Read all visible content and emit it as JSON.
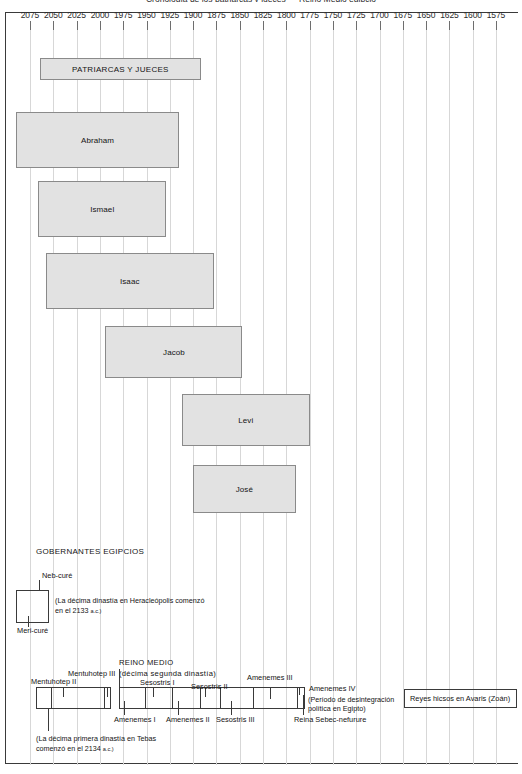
{
  "chart_title": "Cronología de los patriarcas y jueces — Reino Medio egipcio",
  "chart_data": {
    "type": "bar",
    "orientation": "horizontal",
    "title": "Cronología de los patriarcas y jueces — Reino Medio egipcio",
    "xlabel": "",
    "ylabel": "",
    "axis": {
      "direction": "descending",
      "unit": "a.C.",
      "start": 2075,
      "end": 1575,
      "step": 25,
      "tick_labels": [
        "2075",
        "2050",
        "2025",
        "2000",
        "1975",
        "1950",
        "1925",
        "1900",
        "1875",
        "1850",
        "1825",
        "1800",
        "1775",
        "1750",
        "1725",
        "1700",
        "1675",
        "1650",
        "1625",
        "1600",
        "1575"
      ],
      "grid": true,
      "legend": "none"
    },
    "sections": [
      {
        "name": "PATRIARCAS Y JUECES"
      },
      {
        "name": "GOBERNANTES EGIPCIOS"
      }
    ],
    "bars": [
      {
        "label": "PATRIARCAS Y JUECES",
        "start": 2064,
        "end": 1892,
        "style": "filled",
        "caps": true
      },
      {
        "label": "Abraham",
        "start": 2090,
        "end": 1915,
        "style": "filled",
        "caps": false
      },
      {
        "label": "Ismael",
        "start": 2066,
        "end": 1929,
        "style": "filled",
        "caps": false
      },
      {
        "label": "Isaac",
        "start": 2058,
        "end": 1878,
        "style": "filled",
        "caps": false
      },
      {
        "label": "Jacob",
        "start": 1994,
        "end": 1847,
        "style": "filled",
        "caps": false
      },
      {
        "label": "Levi",
        "start": 1912,
        "end": 1775,
        "style": "filled",
        "caps": false
      },
      {
        "label": "José",
        "start": 1900,
        "end": 1790,
        "style": "filled",
        "caps": false
      }
    ],
    "egyptian_rulers": {
      "heading": "GOBERNANTES EGIPCIOS",
      "early": {
        "rulers": [
          "Neb-curé",
          "Meri-curé"
        ],
        "note": "(La décima dinastía en Heracleópolis comenzó en el 2133 a.c.)"
      },
      "middle_kingdom": {
        "heading_line1": "REINO MEDIO",
        "heading_line2": "(décima segunda dinastía)",
        "rulers_above": [
          "Mentuhotep II",
          "Mentuhotep III",
          "Sesostris I",
          "Sesostris II",
          "Amenemes III",
          "Amenemes IV"
        ],
        "rulers_below": [
          "Amenemes I",
          "Amenemes II",
          "Sesostris III",
          "Reina Sebec-nefurure"
        ],
        "note_right_line1": "(Período de desintegración",
        "note_right_line2": "política en Egipto)",
        "note_below": "(La décima primera dinastía en Tebas comenzó en el 2134 a.c.)"
      },
      "hyksos": {
        "label": "Reyes hicsos en Avaris (Zoán)"
      }
    },
    "colors": {
      "bar_fill": "#e2e2e2",
      "bar_border": "#8a8a8a",
      "grid": "#d7d7d7",
      "frame": "#3a3a3a",
      "text": "#141414"
    }
  },
  "labels": {
    "title": "Cronología de los patriarcas y jueces — Reino Medio egipcio",
    "patriarcas": "PATRIARCAS Y JUECES",
    "abraham": "Abraham",
    "ismael": "Ismael",
    "isaac": "Isaac",
    "jacob": "Jacob",
    "levi": "Levi",
    "jose": "José",
    "gobernantes": "GOBERNANTES EGIPCIOS",
    "neb_cure": "Neb-curé",
    "meri_cure": "Meri-curé",
    "note_heracleopolis_l1": "(La décima dinastía en Heracleópolis comenzó",
    "note_heracleopolis_l2": "en el 2133 ",
    "note_heracleopolis_sc": "a.c.)",
    "reino_medio_l1": "REINO MEDIO",
    "reino_medio_l2": "(décima segunda dinastía)",
    "mentuhotep_ii": "Mentuhotep II",
    "mentuhotep_iii": "Mentuhotep III",
    "sesostris_i": "Sesostris I",
    "sesostris_ii": "Sesostris II",
    "amenemes_iii": "Amenemes III",
    "amenemes_iv": "Amenemes IV",
    "amenemes_i": "Amenemes I",
    "amenemes_ii": "Amenemes II",
    "sesostris_iii": "Sesostris III",
    "reina_sebec": "Reina Sebec-nefurure",
    "desintegracion_l1": "(Período de desintegración",
    "desintegracion_l2": "política en Egipto)",
    "note_tebas_l1": "(La décima primera dinastía en Tebas",
    "note_tebas_l2": "comenzó en el 2134 ",
    "note_tebas_sc": "a.c.)",
    "hyksos": "Reyes hicsos en Avaris (Zoán)"
  }
}
